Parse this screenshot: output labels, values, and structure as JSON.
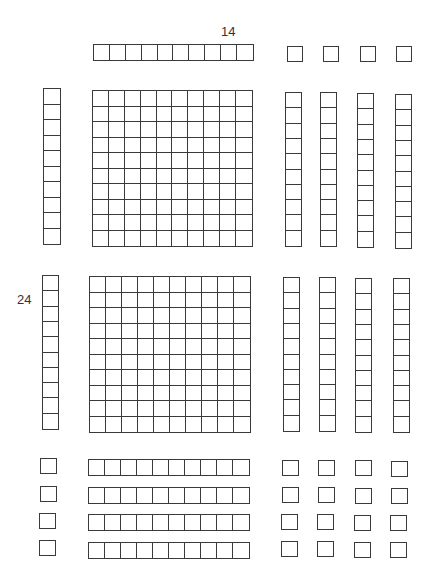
{
  "diagram": {
    "type": "base-ten-blocks",
    "line_color": "#3a3a3a",
    "background": "#ffffff",
    "labels": {
      "top_factor": "14",
      "left_factor": "24"
    },
    "label_positions": {
      "top_factor": {
        "x": 221,
        "y": 25
      },
      "left_factor": {
        "x": 17,
        "y": 293
      }
    },
    "blocks": [
      {
        "kind": "ten-rod-horizontal",
        "group": "top-header",
        "x": 93,
        "y": 44,
        "w": 161,
        "h": 17,
        "cols": 10,
        "rows": 1
      },
      {
        "kind": "unit-cube",
        "group": "top-header",
        "x": 287,
        "y": 46,
        "w": 16,
        "h": 16,
        "cols": 1,
        "rows": 1
      },
      {
        "kind": "unit-cube",
        "group": "top-header",
        "x": 323,
        "y": 46,
        "w": 16,
        "h": 16,
        "cols": 1,
        "rows": 1
      },
      {
        "kind": "unit-cube",
        "group": "top-header",
        "x": 360,
        "y": 46,
        "w": 16,
        "h": 16,
        "cols": 1,
        "rows": 1
      },
      {
        "kind": "unit-cube",
        "group": "top-header",
        "x": 396,
        "y": 46,
        "w": 16,
        "h": 16,
        "cols": 1,
        "rows": 1
      },
      {
        "kind": "ten-rod-vertical",
        "group": "left-header",
        "x": 43,
        "y": 88,
        "w": 18,
        "h": 157,
        "cols": 1,
        "rows": 10
      },
      {
        "kind": "hundred-flat",
        "group": "product",
        "x": 92,
        "y": 90,
        "w": 161,
        "h": 157,
        "cols": 10,
        "rows": 10
      },
      {
        "kind": "ten-rod-vertical",
        "group": "product",
        "x": 285,
        "y": 92,
        "w": 17,
        "h": 155,
        "cols": 1,
        "rows": 10
      },
      {
        "kind": "ten-rod-vertical",
        "group": "product",
        "x": 320,
        "y": 92,
        "w": 17,
        "h": 155,
        "cols": 1,
        "rows": 10
      },
      {
        "kind": "ten-rod-vertical",
        "group": "product",
        "x": 357,
        "y": 93,
        "w": 17,
        "h": 155,
        "cols": 1,
        "rows": 10
      },
      {
        "kind": "ten-rod-vertical",
        "group": "product",
        "x": 395,
        "y": 94,
        "w": 17,
        "h": 155,
        "cols": 1,
        "rows": 10
      },
      {
        "kind": "ten-rod-vertical",
        "group": "left-header",
        "x": 42,
        "y": 275,
        "w": 17,
        "h": 155,
        "cols": 1,
        "rows": 10
      },
      {
        "kind": "hundred-flat",
        "group": "product",
        "x": 89,
        "y": 276,
        "w": 162,
        "h": 157,
        "cols": 10,
        "rows": 10
      },
      {
        "kind": "ten-rod-vertical",
        "group": "product",
        "x": 283,
        "y": 277,
        "w": 17,
        "h": 155,
        "cols": 1,
        "rows": 10
      },
      {
        "kind": "ten-rod-vertical",
        "group": "product",
        "x": 319,
        "y": 277,
        "w": 17,
        "h": 155,
        "cols": 1,
        "rows": 10
      },
      {
        "kind": "ten-rod-vertical",
        "group": "product",
        "x": 355,
        "y": 278,
        "w": 17,
        "h": 155,
        "cols": 1,
        "rows": 10
      },
      {
        "kind": "ten-rod-vertical",
        "group": "product",
        "x": 393,
        "y": 278,
        "w": 17,
        "h": 155,
        "cols": 1,
        "rows": 10
      },
      {
        "kind": "unit-cube",
        "group": "left-header",
        "x": 40,
        "y": 458,
        "w": 17,
        "h": 16,
        "cols": 1,
        "rows": 1
      },
      {
        "kind": "ten-rod-horizontal",
        "group": "product",
        "x": 88,
        "y": 459,
        "w": 162,
        "h": 17,
        "cols": 10,
        "rows": 1
      },
      {
        "kind": "unit-cube",
        "group": "product",
        "x": 282,
        "y": 460,
        "w": 17,
        "h": 16,
        "cols": 1,
        "rows": 1
      },
      {
        "kind": "unit-cube",
        "group": "product",
        "x": 318,
        "y": 460,
        "w": 17,
        "h": 16,
        "cols": 1,
        "rows": 1
      },
      {
        "kind": "unit-cube",
        "group": "product",
        "x": 355,
        "y": 460,
        "w": 17,
        "h": 16,
        "cols": 1,
        "rows": 1
      },
      {
        "kind": "unit-cube",
        "group": "product",
        "x": 391,
        "y": 461,
        "w": 17,
        "h": 16,
        "cols": 1,
        "rows": 1
      },
      {
        "kind": "unit-cube",
        "group": "left-header",
        "x": 40,
        "y": 486,
        "w": 17,
        "h": 16,
        "cols": 1,
        "rows": 1
      },
      {
        "kind": "ten-rod-horizontal",
        "group": "product",
        "x": 88,
        "y": 487,
        "w": 162,
        "h": 17,
        "cols": 10,
        "rows": 1
      },
      {
        "kind": "unit-cube",
        "group": "product",
        "x": 282,
        "y": 487,
        "w": 17,
        "h": 16,
        "cols": 1,
        "rows": 1
      },
      {
        "kind": "unit-cube",
        "group": "product",
        "x": 318,
        "y": 487,
        "w": 17,
        "h": 16,
        "cols": 1,
        "rows": 1
      },
      {
        "kind": "unit-cube",
        "group": "product",
        "x": 355,
        "y": 488,
        "w": 17,
        "h": 16,
        "cols": 1,
        "rows": 1
      },
      {
        "kind": "unit-cube",
        "group": "product",
        "x": 391,
        "y": 488,
        "w": 17,
        "h": 16,
        "cols": 1,
        "rows": 1
      },
      {
        "kind": "unit-cube",
        "group": "left-header",
        "x": 39,
        "y": 513,
        "w": 17,
        "h": 16,
        "cols": 1,
        "rows": 1
      },
      {
        "kind": "ten-rod-horizontal",
        "group": "product",
        "x": 88,
        "y": 514,
        "w": 162,
        "h": 17,
        "cols": 10,
        "rows": 1
      },
      {
        "kind": "unit-cube",
        "group": "product",
        "x": 281,
        "y": 514,
        "w": 17,
        "h": 16,
        "cols": 1,
        "rows": 1
      },
      {
        "kind": "unit-cube",
        "group": "product",
        "x": 317,
        "y": 514,
        "w": 17,
        "h": 16,
        "cols": 1,
        "rows": 1
      },
      {
        "kind": "unit-cube",
        "group": "product",
        "x": 354,
        "y": 515,
        "w": 17,
        "h": 16,
        "cols": 1,
        "rows": 1
      },
      {
        "kind": "unit-cube",
        "group": "product",
        "x": 390,
        "y": 515,
        "w": 17,
        "h": 16,
        "cols": 1,
        "rows": 1
      },
      {
        "kind": "unit-cube",
        "group": "left-header",
        "x": 39,
        "y": 540,
        "w": 17,
        "h": 16,
        "cols": 1,
        "rows": 1
      },
      {
        "kind": "ten-rod-horizontal",
        "group": "product",
        "x": 88,
        "y": 542,
        "w": 162,
        "h": 17,
        "cols": 10,
        "rows": 1
      },
      {
        "kind": "unit-cube",
        "group": "product",
        "x": 281,
        "y": 541,
        "w": 17,
        "h": 16,
        "cols": 1,
        "rows": 1
      },
      {
        "kind": "unit-cube",
        "group": "product",
        "x": 317,
        "y": 541,
        "w": 17,
        "h": 16,
        "cols": 1,
        "rows": 1
      },
      {
        "kind": "unit-cube",
        "group": "product",
        "x": 354,
        "y": 542,
        "w": 17,
        "h": 16,
        "cols": 1,
        "rows": 1
      },
      {
        "kind": "unit-cube",
        "group": "product",
        "x": 390,
        "y": 542,
        "w": 17,
        "h": 16,
        "cols": 1,
        "rows": 1
      }
    ],
    "summary": {
      "hundreds_flats": 2,
      "ten_rods_in_product": 12,
      "unit_cubes_in_product": 16,
      "product_value": 336
    }
  }
}
